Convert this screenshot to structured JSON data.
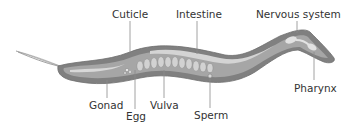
{
  "diagram": {
    "labels": [
      {
        "id": "cuticle",
        "text": "Cuticle"
      },
      {
        "id": "intestine",
        "text": "Intestine"
      },
      {
        "id": "nervous_system",
        "text": "Nervous system"
      },
      {
        "id": "gonad",
        "text": "Gonad"
      },
      {
        "id": "egg",
        "text": "Egg"
      },
      {
        "id": "vulva",
        "text": "Vulva"
      },
      {
        "id": "sperm",
        "text": "Sperm"
      },
      {
        "id": "pharynx",
        "text": "Pharynx"
      }
    ],
    "colors": {
      "body_outer": "#7d7d7d",
      "body_inner": "#a9a9a9",
      "organ_light": "#d6d6d6",
      "leader_line": "#8a8a8a",
      "text": "#333333"
    }
  }
}
